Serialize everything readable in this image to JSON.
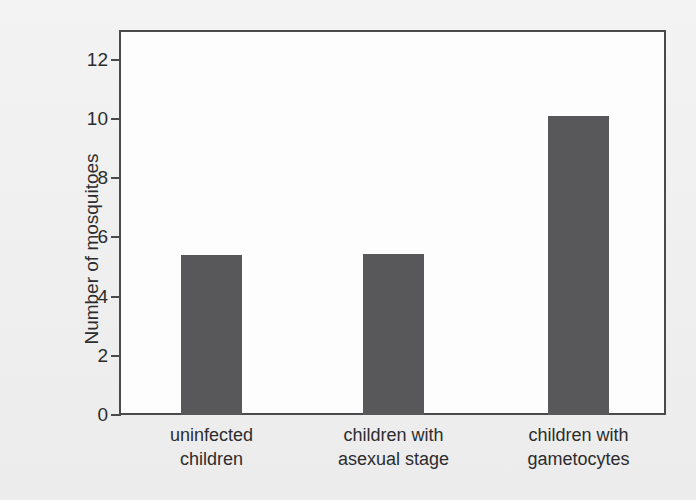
{
  "chart_data": {
    "type": "bar",
    "title": "",
    "xlabel": "",
    "ylabel": "Number of mosquitoes",
    "categories": [
      "uninfected children",
      "children with asexual stage",
      "children with gametocytes"
    ],
    "category_lines": [
      [
        "uninfected",
        "children"
      ],
      [
        "children with",
        "asexual stage"
      ],
      [
        "children with",
        "gametocytes"
      ]
    ],
    "values": [
      5.4,
      5.45,
      10.1
    ],
    "ylim": [
      0,
      13
    ],
    "yticks": [
      0,
      2,
      4,
      6,
      8,
      10,
      12
    ],
    "ytick_labels": [
      "0",
      "2",
      "4",
      "6",
      "8",
      "10",
      "12"
    ],
    "grid": false,
    "legend": false,
    "bar_color": "#58585b",
    "axis_color": "#4a4a4d",
    "plot_background": "#fdfdfd",
    "page_background": "#f1f1f1"
  }
}
